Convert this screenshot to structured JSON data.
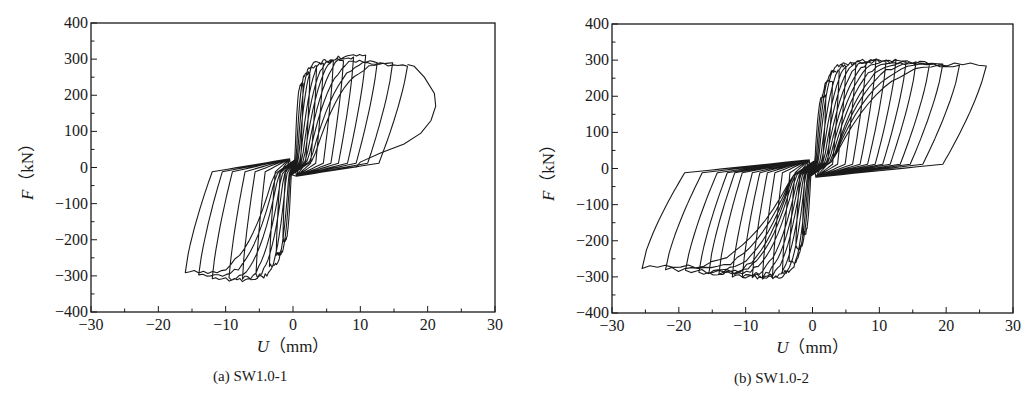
{
  "chart_data": [
    {
      "type": "line",
      "subtype": "hysteresis",
      "id": "a",
      "caption": "(a) SW1.0-1",
      "xlabel_var": "U",
      "xlabel_unit": "（mm）",
      "ylabel_var": "F",
      "ylabel_unit": "（kN）",
      "xlim": [
        -30,
        30
      ],
      "ylim": [
        -400,
        400
      ],
      "xticks": [
        -30,
        -20,
        -10,
        0,
        10,
        20,
        30
      ],
      "yticks": [
        400,
        300,
        200,
        100,
        0,
        -100,
        -200,
        -300,
        -400
      ],
      "xtick_labels": [
        "−30",
        "−20",
        "−10",
        "0",
        "10",
        "20",
        "30"
      ],
      "ytick_labels": [
        "400",
        "300",
        "200",
        "100",
        "0",
        "−100",
        "−200",
        "−300",
        "−400"
      ],
      "grid": false,
      "legend": null,
      "line_color": "#1a1a1a",
      "cycles": [
        {
          "pos_u": 1.5,
          "pos_f": 230,
          "neg_u": -1.5,
          "neg_f": -200
        },
        {
          "pos_u": 2.5,
          "pos_f": 260,
          "neg_u": -2.5,
          "neg_f": -240
        },
        {
          "pos_u": 3.5,
          "pos_f": 280,
          "neg_u": -3.5,
          "neg_f": -270
        },
        {
          "pos_u": 4.5,
          "pos_f": 290,
          "neg_u": -5.5,
          "neg_f": -300
        },
        {
          "pos_u": 6.0,
          "pos_f": 295,
          "neg_u": -7.5,
          "neg_f": -305
        },
        {
          "pos_u": 7.5,
          "pos_f": 300,
          "neg_u": -9.5,
          "neg_f": -310
        },
        {
          "pos_u": 9.0,
          "pos_f": 305,
          "neg_u": -12.0,
          "neg_f": -310
        },
        {
          "pos_u": 10.8,
          "pos_f": 308,
          "neg_u": -14.0,
          "neg_f": -300
        },
        {
          "pos_u": 12.5,
          "pos_f": 295,
          "neg_u": -16.0,
          "neg_f": -290
        },
        {
          "pos_u": 14.8,
          "pos_f": 290,
          "neg_u": null,
          "neg_f": null
        },
        {
          "pos_u": 17.0,
          "pos_f": 285,
          "neg_u": null,
          "neg_f": null
        }
      ],
      "final_branch": [
        [
          17.0,
          285
        ],
        [
          18.0,
          280
        ],
        [
          19.5,
          250
        ],
        [
          21.0,
          205
        ],
        [
          21.2,
          170
        ],
        [
          20.5,
          130
        ],
        [
          19.0,
          95
        ],
        [
          16.5,
          65
        ],
        [
          13.0,
          40
        ],
        [
          10.0,
          15
        ],
        [
          9.3,
          0
        ]
      ],
      "pinch_force": 20
    },
    {
      "type": "line",
      "subtype": "hysteresis",
      "id": "b",
      "caption": "(b) SW1.0-2",
      "xlabel_var": "U",
      "xlabel_unit": "（mm）",
      "ylabel_var": "F",
      "ylabel_unit": "（kN）",
      "xlim": [
        -30,
        30
      ],
      "ylim": [
        -400,
        400
      ],
      "xticks": [
        -30,
        -20,
        -10,
        0,
        10,
        20,
        30
      ],
      "yticks": [
        400,
        300,
        200,
        100,
        0,
        -100,
        -200,
        -300,
        -400
      ],
      "xtick_labels": [
        "−30",
        "−20",
        "−10",
        "0",
        "10",
        "20",
        "30"
      ],
      "ytick_labels": [
        "400",
        "300",
        "200",
        "100",
        "0",
        "−100",
        "−200",
        "−300",
        "−400"
      ],
      "grid": false,
      "legend": null,
      "line_color": "#1a1a1a",
      "cycles": [
        {
          "pos_u": 2.0,
          "pos_f": 200,
          "neg_u": -1.5,
          "neg_f": -180
        },
        {
          "pos_u": 3.0,
          "pos_f": 240,
          "neg_u": -2.5,
          "neg_f": -220
        },
        {
          "pos_u": 4.0,
          "pos_f": 270,
          "neg_u": -3.5,
          "neg_f": -260
        },
        {
          "pos_u": 5.0,
          "pos_f": 285,
          "neg_u": -4.5,
          "neg_f": -285
        },
        {
          "pos_u": 6.5,
          "pos_f": 290,
          "neg_u": -6.0,
          "neg_f": -298
        },
        {
          "pos_u": 8.0,
          "pos_f": 295,
          "neg_u": -7.5,
          "neg_f": -300
        },
        {
          "pos_u": 9.5,
          "pos_f": 300,
          "neg_u": -9.0,
          "neg_f": -300
        },
        {
          "pos_u": 11.0,
          "pos_f": 298,
          "neg_u": -10.5,
          "neg_f": -298
        },
        {
          "pos_u": 12.5,
          "pos_f": 298,
          "neg_u": -12.0,
          "neg_f": -295
        },
        {
          "pos_u": 14.0,
          "pos_f": 296,
          "neg_u": -14.0,
          "neg_f": -290
        },
        {
          "pos_u": 15.5,
          "pos_f": 295,
          "neg_u": -15.5,
          "neg_f": -285
        },
        {
          "pos_u": 17.5,
          "pos_f": 292,
          "neg_u": -17.0,
          "neg_f": -290
        },
        {
          "pos_u": 19.5,
          "pos_f": 290,
          "neg_u": -19.0,
          "neg_f": -285
        },
        {
          "pos_u": 22.0,
          "pos_f": 285,
          "neg_u": -22.0,
          "neg_f": -280
        },
        {
          "pos_u": 26.0,
          "pos_f": 288,
          "neg_u": -25.5,
          "neg_f": -272
        }
      ],
      "final_branch": [],
      "pinch_force": 20
    }
  ]
}
